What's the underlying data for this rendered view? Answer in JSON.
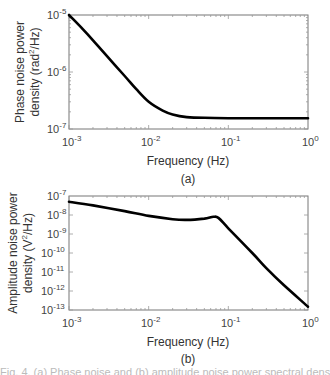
{
  "chart_data": [
    {
      "type": "line",
      "panel": "(a)",
      "xlabel": "Frequency (Hz)",
      "ylabel_line1": "Phase noise power",
      "ylabel_line2": "density (rad²/Hz)",
      "xscale": "log",
      "yscale": "log",
      "xlim": [
        0.001,
        1
      ],
      "ylim": [
        1e-07,
        1e-05
      ],
      "x_ticks": [
        "10^-3",
        "10^-2",
        "10^-1",
        "10^0"
      ],
      "y_ticks": [
        "10^-7",
        "10^-6",
        "10^-5"
      ],
      "grid": false,
      "series": [
        {
          "name": "Phase noise PSD",
          "x": [
            0.001,
            0.0015,
            0.002,
            0.003,
            0.005,
            0.007,
            0.01,
            0.015,
            0.02,
            0.03,
            0.05,
            0.1,
            0.3,
            1
          ],
          "y": [
            1e-05,
            5.6e-06,
            3.6e-06,
            1.9e-06,
            8.5e-07,
            5e-07,
            3e-07,
            2.1e-07,
            1.8e-07,
            1.62e-07,
            1.57e-07,
            1.55e-07,
            1.55e-07,
            1.55e-07
          ]
        }
      ]
    },
    {
      "type": "line",
      "panel": "(b)",
      "xlabel": "Frequency (Hz)",
      "ylabel_line1": "Amplitude noise power",
      "ylabel_line2": "density (V²/Hz)",
      "xscale": "log",
      "yscale": "log",
      "xlim": [
        0.001,
        1
      ],
      "ylim": [
        1e-13,
        1e-07
      ],
      "x_ticks": [
        "10^-3",
        "10^-2",
        "10^-1",
        "10^0"
      ],
      "y_ticks": [
        "10^-13",
        "10^-12",
        "10^-11",
        "10^-10",
        "10^-9",
        "10^-8",
        "10^-7"
      ],
      "grid": false,
      "series": [
        {
          "name": "Amplitude noise PSD",
          "x": [
            0.001,
            0.002,
            0.005,
            0.01,
            0.02,
            0.03,
            0.05,
            0.065,
            0.075,
            0.1,
            0.2,
            0.3,
            0.5,
            1
          ],
          "y": [
            5e-08,
            3.2e-08,
            1.6e-08,
            9e-09,
            6e-09,
            5.5e-09,
            6.5e-09,
            8e-09,
            7e-09,
            2e-09,
            1e-10,
            1.6e-11,
            2e-12,
            1.5e-13
          ]
        }
      ]
    }
  ],
  "panels": {
    "a": {
      "label": "(a)",
      "xlabel": "Frequency (Hz)",
      "ylabel_line1": "Phase noise power",
      "ylabel_line2": "density (rad",
      "ylabel_sup": "2",
      "ylabel_tail": "/Hz)"
    },
    "b": {
      "label": "(b)",
      "xlabel": "Frequency (Hz)",
      "ylabel_line1": "Amplitude noise power",
      "ylabel_line2": "density (V",
      "ylabel_sup": "2",
      "ylabel_tail": "/Hz)"
    }
  },
  "ticks": {
    "x": [
      {
        "base": "10",
        "exp": "-3"
      },
      {
        "base": "10",
        "exp": "-2"
      },
      {
        "base": "10",
        "exp": "-1"
      },
      {
        "base": "10",
        "exp": "0"
      }
    ],
    "ya": [
      {
        "base": "10",
        "exp": "-5"
      },
      {
        "base": "10",
        "exp": "-6"
      },
      {
        "base": "10",
        "exp": "-7"
      }
    ],
    "yb": [
      {
        "base": "10",
        "exp": "-7"
      },
      {
        "base": "10",
        "exp": "-8"
      },
      {
        "base": "10",
        "exp": "-9"
      },
      {
        "base": "10",
        "exp": "-10"
      },
      {
        "base": "10",
        "exp": "-11"
      },
      {
        "base": "10",
        "exp": "-12"
      },
      {
        "base": "10",
        "exp": "-13"
      }
    ]
  },
  "caption": "Fig. 4. (a) Phase noise and (b) amplitude noise power spectral density"
}
